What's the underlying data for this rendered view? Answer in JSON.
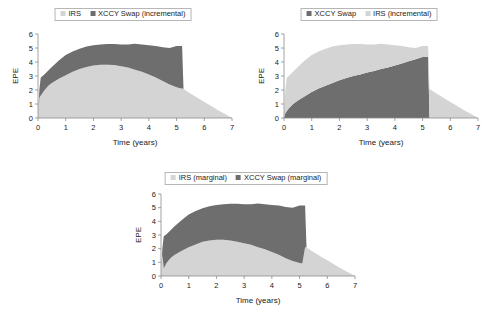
{
  "figure": {
    "background": "#ffffff",
    "colors": {
      "light_gray": "#d4d4d4",
      "dark_gray": "#6e6e6e",
      "axis": "#8a8a8a",
      "text": "#222222"
    }
  },
  "panels": [
    {
      "id": "incremental-irs",
      "legend": [
        {
          "label": "IRS",
          "color": "#d4d4d4",
          "swatch": "square-swatch"
        },
        {
          "label": "XCCY Swap (incremental)",
          "color": "#6e6e6e",
          "swatch": "square-swatch"
        }
      ],
      "chart_data": {
        "type": "area",
        "stacked": true,
        "title": "",
        "xlabel": "Time (years)",
        "ylabel": "EPE",
        "xlim": [
          0,
          7
        ],
        "ylim": [
          0,
          6
        ],
        "xticks": [
          0,
          1,
          2,
          3,
          4,
          5,
          6,
          7
        ],
        "yticks": [
          0,
          1,
          2,
          3,
          4,
          5,
          6
        ],
        "grid": false,
        "legend_position": "top-center",
        "x": [
          0,
          0.05,
          0.1,
          0.2,
          0.3,
          0.4,
          0.5,
          0.75,
          1.0,
          1.25,
          1.5,
          1.75,
          2.0,
          2.25,
          2.5,
          2.75,
          3.0,
          3.25,
          3.5,
          3.75,
          4.0,
          4.25,
          4.5,
          4.75,
          5.0,
          5.1,
          5.2,
          5.25,
          5.5,
          5.75,
          6.0,
          6.25,
          6.5,
          6.75,
          7.0
        ],
        "series": [
          {
            "name": "IRS",
            "color": "#d4d4d4",
            "values": [
              0.0,
              1.45,
              1.6,
              1.9,
              2.15,
              2.35,
              2.5,
              2.8,
              3.05,
              3.3,
              3.5,
              3.65,
              3.75,
              3.8,
              3.8,
              3.78,
              3.7,
              3.6,
              3.45,
              3.3,
              3.1,
              2.9,
              2.65,
              2.4,
              2.2,
              2.15,
              2.1,
              2.08,
              1.75,
              1.45,
              1.15,
              0.85,
              0.55,
              0.28,
              0.0
            ]
          },
          {
            "name": "XCCY Swap (incremental)",
            "color": "#6e6e6e",
            "values": [
              0.0,
              0.6,
              1.3,
              1.15,
              1.1,
              1.1,
              1.15,
              1.3,
              1.45,
              1.45,
              1.45,
              1.45,
              1.45,
              1.45,
              1.48,
              1.5,
              1.55,
              1.65,
              1.8,
              1.95,
              2.1,
              2.25,
              2.4,
              2.6,
              2.95,
              3.0,
              3.05,
              0.0,
              0.0,
              0.0,
              0.0,
              0.0,
              0.0,
              0.0,
              0.0
            ]
          }
        ],
        "stack_top": [
          0.0,
          2.05,
          2.9,
          3.05,
          3.25,
          3.45,
          3.65,
          4.1,
          4.5,
          4.75,
          4.95,
          5.1,
          5.2,
          5.25,
          5.28,
          5.28,
          5.25,
          5.25,
          5.3,
          5.25,
          5.2,
          5.15,
          5.05,
          5.0,
          5.15,
          5.15,
          5.15,
          2.08,
          1.75,
          1.45,
          1.15,
          0.85,
          0.55,
          0.28,
          0.0
        ]
      }
    },
    {
      "id": "incremental-xccy",
      "legend": [
        {
          "label": "XCCY Swap",
          "color": "#6e6e6e",
          "swatch": "square-swatch"
        },
        {
          "label": "IRS (incremental)",
          "color": "#d4d4d4",
          "swatch": "square-swatch"
        }
      ],
      "chart_data": {
        "type": "area",
        "stacked": true,
        "title": "",
        "xlabel": "Time (years)",
        "ylabel": "EPE",
        "xlim": [
          0,
          7
        ],
        "ylim": [
          0,
          6
        ],
        "xticks": [
          0,
          1,
          2,
          3,
          4,
          5,
          6,
          7
        ],
        "yticks": [
          0,
          1,
          2,
          3,
          4,
          5,
          6
        ],
        "grid": false,
        "legend_position": "top-center",
        "x": [
          0,
          0.05,
          0.1,
          0.2,
          0.3,
          0.4,
          0.5,
          0.75,
          1.0,
          1.25,
          1.5,
          1.75,
          2.0,
          2.25,
          2.5,
          2.75,
          3.0,
          3.25,
          3.5,
          3.75,
          4.0,
          4.25,
          4.5,
          4.75,
          5.0,
          5.1,
          5.2,
          5.25,
          5.5,
          5.75,
          6.0,
          6.25,
          6.5,
          6.75,
          7.0
        ],
        "series": [
          {
            "name": "XCCY Swap",
            "color": "#6e6e6e",
            "values": [
              0.0,
              0.35,
              0.5,
              0.75,
              0.95,
              1.1,
              1.25,
              1.55,
              1.85,
              2.1,
              2.3,
              2.5,
              2.7,
              2.85,
              3.0,
              3.1,
              3.25,
              3.35,
              3.5,
              3.6,
              3.75,
              3.9,
              4.05,
              4.2,
              4.35,
              4.35,
              4.35,
              0.0,
              0.0,
              0.0,
              0.0,
              0.0,
              0.0,
              0.0,
              0.0
            ]
          },
          {
            "name": "IRS (incremental)",
            "color": "#d4d4d4",
            "values": [
              0.0,
              1.7,
              2.4,
              2.3,
              2.3,
              2.35,
              2.4,
              2.55,
              2.65,
              2.65,
              2.65,
              2.6,
              2.5,
              2.4,
              2.28,
              2.18,
              2.0,
              1.9,
              1.8,
              1.65,
              1.45,
              1.25,
              1.0,
              0.8,
              0.8,
              0.8,
              0.8,
              2.08,
              1.75,
              1.45,
              1.15,
              0.85,
              0.55,
              0.28,
              0.0
            ]
          }
        ],
        "stack_top": [
          0.0,
          2.05,
          2.9,
          3.05,
          3.25,
          3.45,
          3.65,
          4.1,
          4.5,
          4.75,
          4.95,
          5.1,
          5.2,
          5.25,
          5.28,
          5.28,
          5.25,
          5.25,
          5.3,
          5.25,
          5.2,
          5.15,
          5.05,
          5.0,
          5.15,
          5.15,
          5.15,
          2.08,
          1.75,
          1.45,
          1.15,
          0.85,
          0.55,
          0.28,
          0.0
        ]
      }
    },
    {
      "id": "marginal",
      "legend": [
        {
          "label": "IRS (marginal)",
          "color": "#d4d4d4",
          "swatch": "square-swatch"
        },
        {
          "label": "XCCY Swap (marginal)",
          "color": "#6e6e6e",
          "swatch": "square-swatch"
        }
      ],
      "chart_data": {
        "type": "area",
        "stacked": true,
        "title": "",
        "xlabel": "Time (years)",
        "ylabel": "EPE",
        "xlim": [
          0,
          7
        ],
        "ylim": [
          0,
          6
        ],
        "xticks": [
          0,
          1,
          2,
          3,
          4,
          5,
          6,
          7
        ],
        "yticks": [
          0,
          1,
          2,
          3,
          4,
          5,
          6
        ],
        "grid": false,
        "legend_position": "top-center",
        "x": [
          0,
          0.05,
          0.1,
          0.2,
          0.3,
          0.4,
          0.5,
          0.75,
          1.0,
          1.25,
          1.5,
          1.75,
          2.0,
          2.25,
          2.5,
          2.75,
          3.0,
          3.25,
          3.5,
          3.75,
          4.0,
          4.25,
          4.5,
          4.75,
          5.0,
          5.1,
          5.2,
          5.25,
          5.5,
          5.75,
          6.0,
          6.25,
          6.5,
          6.75,
          7.0
        ],
        "series": [
          {
            "name": "IRS (marginal)",
            "color": "#d4d4d4",
            "values": [
              0.0,
              1.55,
              0.55,
              0.95,
              1.2,
              1.4,
              1.55,
              1.85,
              2.1,
              2.3,
              2.5,
              2.6,
              2.65,
              2.65,
              2.6,
              2.5,
              2.4,
              2.28,
              2.1,
              1.95,
              1.75,
              1.55,
              1.3,
              1.1,
              0.95,
              0.92,
              2.1,
              2.08,
              1.75,
              1.45,
              1.15,
              0.85,
              0.55,
              0.28,
              0.0
            ]
          },
          {
            "name": "XCCY Swap (marginal)",
            "color": "#6e6e6e",
            "values": [
              0.0,
              0.5,
              2.35,
              2.1,
              2.05,
              2.05,
              2.1,
              2.25,
              2.4,
              2.45,
              2.45,
              2.5,
              2.55,
              2.6,
              2.68,
              2.78,
              2.85,
              2.97,
              3.2,
              3.3,
              3.45,
              3.6,
              3.75,
              3.9,
              4.2,
              4.23,
              3.05,
              0.0,
              0.0,
              0.0,
              0.0,
              0.0,
              0.0,
              0.0,
              0.0
            ]
          }
        ],
        "stack_top": [
          0.0,
          2.05,
          2.9,
          3.05,
          3.25,
          3.45,
          3.65,
          4.1,
          4.5,
          4.75,
          4.95,
          5.1,
          5.2,
          5.25,
          5.28,
          5.28,
          5.25,
          5.25,
          5.3,
          5.25,
          5.2,
          5.15,
          5.05,
          5.0,
          5.15,
          5.15,
          5.15,
          2.08,
          1.75,
          1.45,
          1.15,
          0.85,
          0.55,
          0.28,
          0.0
        ]
      }
    }
  ]
}
